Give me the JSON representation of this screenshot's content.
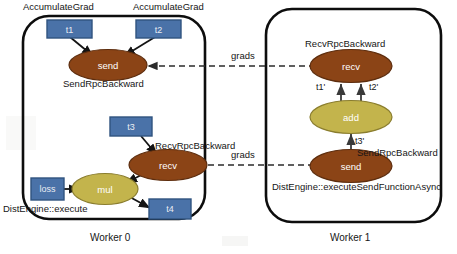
{
  "diagram": {
    "colors": {
      "send_recv_fill": "#8B4416",
      "send_recv_stroke": "#5d2d0e",
      "compute_fill": "#C3B44C",
      "compute_stroke": "#8a7d2e",
      "tensor_fill": "#4A72A8",
      "tensor_stroke": "#2f537f",
      "frame_stroke": "#0d0d0d",
      "edge_stroke": "#141414",
      "rpc_stroke": "#333333",
      "text": "#161616"
    },
    "workers": [
      {
        "id": "worker-0",
        "caption": "Worker 0",
        "engine_label": "DistEngine::execute",
        "annotations": [
          {
            "name": "accumulate-grad-t1",
            "text": "AccumulateGrad"
          },
          {
            "name": "accumulate-grad-t2",
            "text": "AccumulateGrad"
          },
          {
            "name": "send-rpc-backward-w0",
            "text": "SendRpcBackward"
          },
          {
            "name": "recv-rpc-backward-w0",
            "text": "RecvRpcBackward"
          }
        ],
        "nodes": [
          {
            "name": "tensor-t1",
            "kind": "tensor",
            "label": "t1"
          },
          {
            "name": "tensor-t2",
            "kind": "tensor",
            "label": "t2"
          },
          {
            "name": "node-send-w0",
            "kind": "rpc",
            "label": "send"
          },
          {
            "name": "tensor-t3",
            "kind": "tensor",
            "label": "t3"
          },
          {
            "name": "node-recv-w0",
            "kind": "rpc",
            "label": "recv"
          },
          {
            "name": "node-mul",
            "kind": "compute",
            "label": "mul"
          },
          {
            "name": "tensor-loss",
            "kind": "tensor",
            "label": "loss"
          },
          {
            "name": "tensor-t4",
            "kind": "tensor",
            "label": "t4"
          }
        ]
      },
      {
        "id": "worker-1",
        "caption": "Worker 1",
        "engine_label": "DistEngine::executeSendFunctionAsync",
        "annotations": [
          {
            "name": "recv-rpc-backward-w1",
            "text": "RecvRpcBackward"
          },
          {
            "name": "send-rpc-backward-w1",
            "text": "SendRpcBackward"
          }
        ],
        "nodes": [
          {
            "name": "node-recv-w1",
            "kind": "rpc",
            "label": "recv"
          },
          {
            "name": "node-add",
            "kind": "compute",
            "label": "add"
          },
          {
            "name": "node-send-w1",
            "kind": "rpc",
            "label": "send"
          }
        ],
        "edge_labels": [
          {
            "name": "edge-label-t1-prime",
            "text": "t1'"
          },
          {
            "name": "edge-label-t2-prime",
            "text": "t2'"
          },
          {
            "name": "edge-label-t3-prime",
            "text": "t3'"
          }
        ]
      }
    ],
    "rpc_links": [
      {
        "name": "rpc-link-grads-top",
        "text": "grads"
      },
      {
        "name": "rpc-link-grads-bottom",
        "text": "grads"
      }
    ]
  }
}
